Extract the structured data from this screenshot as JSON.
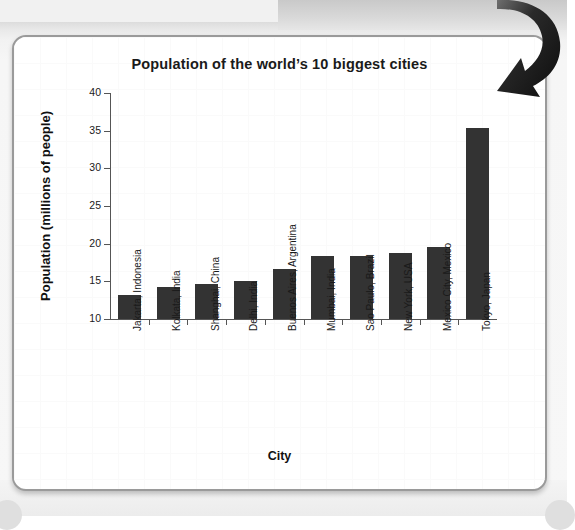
{
  "page": {
    "card_border_color": "#9a9a9a",
    "card_background": "#ffffff",
    "page_background": "#f4f4f4"
  },
  "annotation": {
    "arrow_icon_name": "curved-down-right-arrow",
    "arrow_color": "#111111"
  },
  "chart_data": {
    "type": "bar",
    "title": "Population of the world’s 10 biggest cities",
    "xlabel": "City",
    "ylabel": "Population (millions of people)",
    "ylim": [
      10,
      40
    ],
    "ytick_labels": [
      "10",
      "15",
      "20",
      "25",
      "30",
      "35",
      "40"
    ],
    "ytick_values": [
      10,
      15,
      20,
      25,
      30,
      35,
      40
    ],
    "grid": false,
    "legend": false,
    "bar_color": "#333333",
    "categories": [
      "Jakarta, Indonesia",
      "Kolkata, India",
      "Shanghai, China",
      "Delhi, India",
      "Buenos Aires, Argentina",
      "Mumbai, India",
      "Sao Paulo, Brazil",
      "New York, USA",
      "Mexico City, Mexico",
      "Tokyo, Japan"
    ],
    "values": [
      13.2,
      14.3,
      14.6,
      15.1,
      16.7,
      18.3,
      18.4,
      18.8,
      19.5,
      35.4
    ]
  }
}
